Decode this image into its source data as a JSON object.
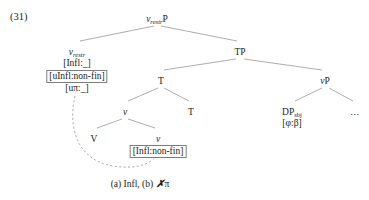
{
  "figure": {
    "example_number": "(31)",
    "caption": {
      "prefix": "(a) Infl, (b) ",
      "xmark": "✗",
      "suffix": "π"
    },
    "colors": {
      "line": "#8a8a8a",
      "text": "#1a1a1a",
      "box_border": "#7d7d7d",
      "dashed_arrow": "#9a9a9a"
    }
  },
  "tree": {
    "nodes": [
      {
        "id": "root",
        "name": "v-restr-p",
        "label_main": "v",
        "label_sub": "restr",
        "label_tail": "P",
        "x": 157,
        "y": 14
      },
      {
        "id": "v-restr-head",
        "name": "v-restr-head",
        "label_main": "v",
        "label_sub": "restr",
        "label_tail": "",
        "features": [
          {
            "text": "[Infl:_]",
            "boxed": false
          },
          {
            "text": "[uInfl:non-fin]",
            "boxed": true
          },
          {
            "text": "[uπ:_]",
            "boxed": false
          }
        ],
        "x": 77,
        "y": 47
      },
      {
        "id": "tp",
        "name": "tp-node",
        "label_main": "TP",
        "label_sub": "",
        "label_tail": "",
        "x": 240,
        "y": 47
      },
      {
        "id": "t-upper",
        "name": "t-upper-node",
        "label_main": "T",
        "label_sub": "",
        "label_tail": "",
        "x": 161,
        "y": 76
      },
      {
        "id": "vp",
        "name": "vp-node",
        "label_main": "v",
        "label_sub": "",
        "label_tail": "P",
        "x": 325,
        "y": 76
      },
      {
        "id": "v-mid",
        "name": "v-middle-node",
        "label_main": "v",
        "label_sub": "",
        "label_tail": "",
        "x": 125,
        "y": 107
      },
      {
        "id": "t-lower",
        "name": "t-lower-node",
        "label_main": "T",
        "label_sub": "",
        "label_tail": "",
        "x": 191,
        "y": 107
      },
      {
        "id": "dp-sbj",
        "name": "dp-subject-node",
        "label_main": "DP",
        "label_sub": "sbj",
        "label_tail": "",
        "features": [
          {
            "text": "[φ:β]",
            "boxed": false
          }
        ],
        "x": 292,
        "y": 107
      },
      {
        "id": "v-terminal-left",
        "name": "v-big-terminal",
        "label_main": "V",
        "label_sub": "",
        "label_tail": "",
        "x": 94,
        "y": 134
      },
      {
        "id": "v-terminal-right",
        "name": "v-small-terminal",
        "label_main": "v",
        "label_sub": "",
        "label_tail": "",
        "features": [
          {
            "text": "[Infl:non-fin]",
            "boxed": true
          }
        ],
        "x": 158,
        "y": 134
      }
    ],
    "ellipsis": {
      "text": "...",
      "x": 355,
      "y": 107
    },
    "edges": [
      {
        "from": "root",
        "to": "v-restr-head",
        "x1": 154,
        "y1": 26,
        "x2": 80,
        "y2": 41
      },
      {
        "from": "root",
        "to": "tp",
        "x1": 161,
        "y1": 26,
        "x2": 237,
        "y2": 41
      },
      {
        "from": "tp",
        "to": "t-upper",
        "x1": 236,
        "y1": 59,
        "x2": 164,
        "y2": 70
      },
      {
        "from": "tp",
        "to": "vp",
        "x1": 244,
        "y1": 59,
        "x2": 322,
        "y2": 70
      },
      {
        "from": "t-upper",
        "to": "v-mid",
        "x1": 158,
        "y1": 88,
        "x2": 128,
        "y2": 101
      },
      {
        "from": "t-upper",
        "to": "t-lower",
        "x1": 164,
        "y1": 88,
        "x2": 189,
        "y2": 101
      },
      {
        "from": "vp",
        "to": "dp-sbj",
        "x1": 322,
        "y1": 88,
        "x2": 295,
        "y2": 101
      },
      {
        "from": "vp",
        "to": "ellipsis",
        "x1": 329,
        "y1": 88,
        "x2": 353,
        "y2": 101
      },
      {
        "from": "v-mid",
        "to": "v-terminal-left",
        "x1": 122,
        "y1": 119,
        "x2": 97,
        "y2": 128
      },
      {
        "from": "v-mid",
        "to": "v-terminal-right",
        "x1": 128,
        "y1": 119,
        "x2": 155,
        "y2": 128
      }
    ],
    "agreement_arrow": {
      "name": "agreement-dashed-arrow",
      "path": "M 75 96 C 68 126 76 160 113 166 C 138 170 152 163 157 155",
      "target_x": 157,
      "target_y": 153
    }
  }
}
